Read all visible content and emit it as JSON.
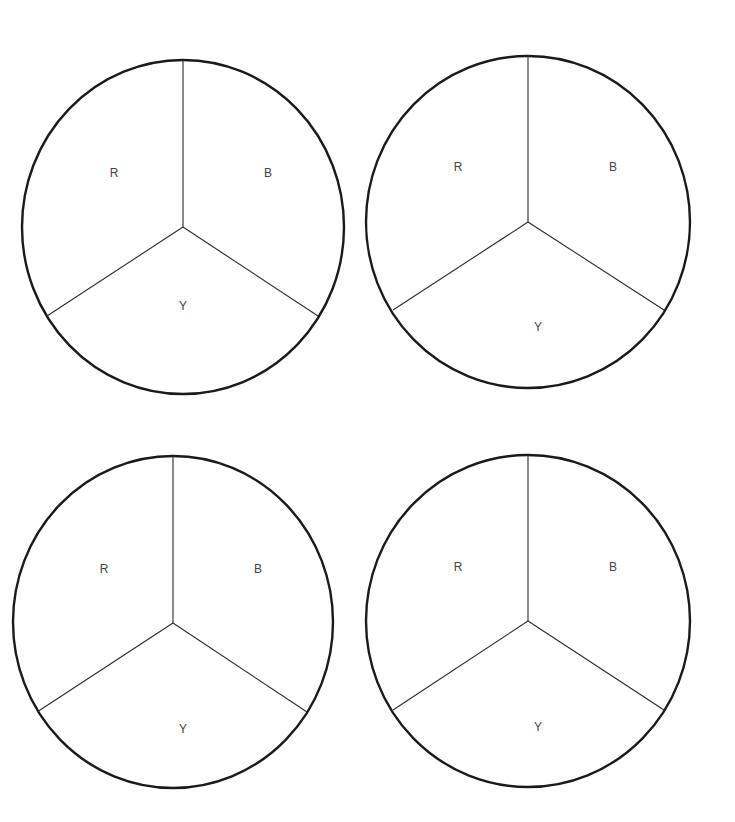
{
  "wheels": [
    {
      "id": "top-left",
      "cx": 183,
      "cy": 227,
      "rx": 161,
      "ry": 167,
      "hub_y": 227,
      "top_y": 60,
      "left_end": [
        47,
        316
      ],
      "right_end": [
        318,
        316
      ],
      "labels": {
        "r": "R",
        "b": "B",
        "y": "Y"
      },
      "label_pos": {
        "r": [
          114,
          174
        ],
        "b": [
          268,
          174
        ],
        "y": [
          183,
          307
        ]
      }
    },
    {
      "id": "top-right",
      "cx": 528,
      "cy": 222,
      "rx": 162,
      "ry": 166,
      "hub_y": 222,
      "top_y": 55,
      "left_end": [
        393,
        310
      ],
      "right_end": [
        664,
        310
      ],
      "labels": {
        "r": "R",
        "b": "B",
        "y": "Y"
      },
      "label_pos": {
        "r": [
          458,
          168
        ],
        "b": [
          613,
          168
        ],
        "y": [
          538,
          328
        ]
      }
    },
    {
      "id": "bottom-left",
      "cx": 173,
      "cy": 622,
      "rx": 160,
      "ry": 166,
      "hub_y": 623,
      "top_y": 456,
      "left_end": [
        37,
        712
      ],
      "right_end": [
        307,
        712
      ],
      "labels": {
        "r": "R",
        "b": "B",
        "y": "Y"
      },
      "label_pos": {
        "r": [
          104,
          570
        ],
        "b": [
          258,
          570
        ],
        "y": [
          183,
          730
        ]
      }
    },
    {
      "id": "bottom-right",
      "cx": 528,
      "cy": 621,
      "rx": 162,
      "ry": 166,
      "hub_y": 621,
      "top_y": 455,
      "left_end": [
        393,
        710
      ],
      "right_end": [
        664,
        710
      ],
      "labels": {
        "r": "R",
        "b": "B",
        "y": "Y"
      },
      "label_pos": {
        "r": [
          458,
          568
        ],
        "b": [
          613,
          568
        ],
        "y": [
          538,
          728
        ]
      }
    }
  ],
  "colors": {
    "outline": "#1a1a1a",
    "divider": "#2a2a2a",
    "label": "#444444",
    "background": "#ffffff"
  }
}
